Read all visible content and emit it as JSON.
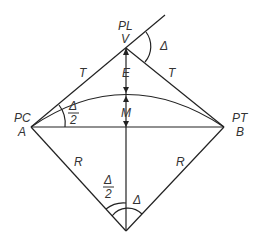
{
  "diagram": {
    "points": {
      "pl_label": "PL",
      "v_label": "V",
      "pc_label": "PC",
      "a_label": "A",
      "pt_label": "PT",
      "b_label": "B"
    },
    "segments": {
      "tangent_left": "T",
      "tangent_right": "T",
      "external": "E",
      "middle_ordinate": "M",
      "radius_left": "R",
      "radius_right": "R"
    },
    "angles": {
      "deflection": "Δ",
      "half_at_pc_num": "Δ",
      "half_at_pc_den": "2",
      "half_at_center_num": "Δ",
      "half_at_center_den": "2",
      "central": "Δ"
    },
    "colors": {
      "stroke": "#222222",
      "text": "#333333"
    }
  }
}
